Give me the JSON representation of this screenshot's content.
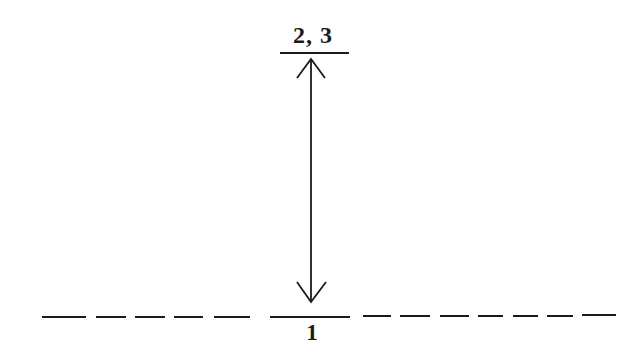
{
  "diagram": {
    "type": "energy-level-transition",
    "upper_level": {
      "label": "2, 3",
      "style": "solid"
    },
    "lower_level": {
      "label": "1",
      "style": "dashed"
    },
    "transition": {
      "arrow": "double-headed",
      "direction": "vertical"
    },
    "colors": {
      "ink": "#1a1a1a",
      "background": "#ffffff"
    }
  }
}
